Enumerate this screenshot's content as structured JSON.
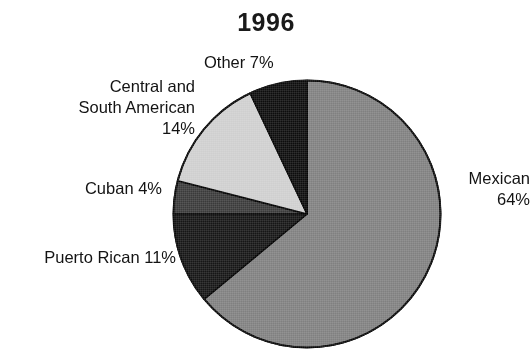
{
  "chart_data": {
    "type": "pie",
    "title": "1996",
    "subtitle": "",
    "xlabel": "",
    "ylabel": "",
    "legend_position": "none",
    "grid": false,
    "start_angle_deg": 0,
    "direction": "clockwise",
    "categories": [
      "Mexican",
      "Puerto Rican",
      "Cuban",
      "Central and South American",
      "Other"
    ],
    "values": [
      64,
      11,
      4,
      14,
      7
    ],
    "unit": "%",
    "slices": [
      {
        "name": "Mexican",
        "value": 64,
        "value_text": "64%",
        "label_text": "Mexican\n64%",
        "color": "#808080",
        "start_deg": 0,
        "end_deg": 230.4
      },
      {
        "name": "Puerto Rican",
        "value": 11,
        "value_text": "11%",
        "label_text": "Puerto Rican 11%",
        "color": "#161616",
        "start_deg": 230.4,
        "end_deg": 270.0
      },
      {
        "name": "Cuban",
        "value": 4,
        "value_text": "4%",
        "label_text": "Cuban 4%",
        "color": "#3a3a3a",
        "start_deg": 270.0,
        "end_deg": 284.4
      },
      {
        "name": "Central and South American",
        "value": 14,
        "value_text": "14%",
        "label_text": "Central and\nSouth American\n14%",
        "color": "#cfcfcf",
        "start_deg": 284.4,
        "end_deg": 334.8
      },
      {
        "name": "Other",
        "value": 7,
        "value_text": "7%",
        "label_text": "Other 7%",
        "color": "#0d0d0d",
        "start_deg": 334.8,
        "end_deg": 360.0
      }
    ],
    "outline_color": "#000000",
    "background_color": "#ffffff",
    "text_color": "#131313"
  },
  "labels": {
    "other": "Other 7%",
    "central_south_american": "Central and\nSouth American\n14%",
    "cuban": "Cuban 4%",
    "puerto_rican": "Puerto Rican 11%",
    "mexican": "Mexican\n64%"
  }
}
